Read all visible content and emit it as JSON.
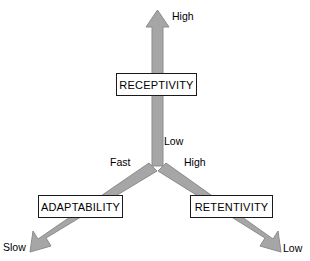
{
  "diagram": {
    "background_color": "#ffffff",
    "arrow_fill_color": "#a6a6a6",
    "arrow_stroke_color": "#8c8c8c",
    "box_border_color": "#1a1a1a",
    "box_fill_color": "#ffffff",
    "text_color": "#000000",
    "nodes": [
      {
        "id": "receptivity",
        "label": "RECEPTIVITY"
      },
      {
        "id": "adaptability",
        "label": "ADAPTABILITY"
      },
      {
        "id": "retentivity",
        "label": "RETENTIVITY"
      }
    ],
    "axes": [
      {
        "id": "receptivity",
        "node_label": "RECEPTIVITY",
        "direction": "up",
        "near_end_label": "Low",
        "far_end_label": "High"
      },
      {
        "id": "adaptability",
        "node_label": "ADAPTABILITY",
        "direction": "down-left",
        "near_end_label": "Fast",
        "far_end_label": "Slow"
      },
      {
        "id": "retentivity",
        "node_label": "RETENTIVITY",
        "direction": "down-right",
        "near_end_label": "High",
        "far_end_label": "Low"
      }
    ],
    "labels": {
      "receptivity_high": "High",
      "receptivity_low": "Low",
      "adaptability_fast": "Fast",
      "adaptability_slow": "Slow",
      "retentivity_high": "High",
      "retentivity_low": "Low"
    }
  }
}
